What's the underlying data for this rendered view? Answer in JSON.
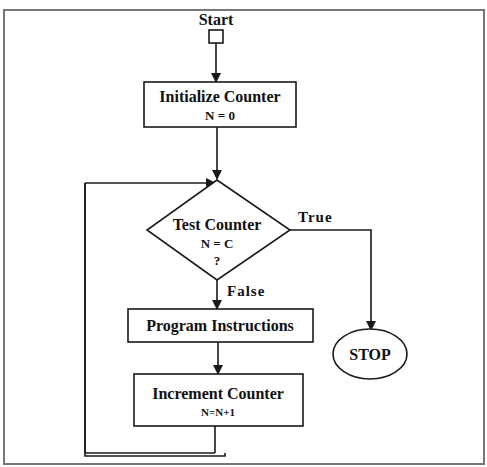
{
  "diagram": {
    "type": "flowchart",
    "start": {
      "label": "Start"
    },
    "nodes": [
      {
        "id": "init",
        "shape": "rectangle",
        "title": "Initialize Counter",
        "subtitle": "N = 0"
      },
      {
        "id": "test",
        "shape": "diamond",
        "title": "Test Counter",
        "line2": "N = C",
        "line3": "?"
      },
      {
        "id": "program",
        "shape": "rectangle",
        "title": "Program Instructions"
      },
      {
        "id": "increment",
        "shape": "rectangle",
        "title": "Increment Counter",
        "subtitle": "N=N+1"
      },
      {
        "id": "stop",
        "shape": "ellipse",
        "title": "STOP"
      }
    ],
    "edges": [
      {
        "from": "start",
        "to": "init"
      },
      {
        "from": "init",
        "to": "test"
      },
      {
        "from": "test",
        "to": "stop",
        "label": "True"
      },
      {
        "from": "test",
        "to": "program",
        "label": "False"
      },
      {
        "from": "program",
        "to": "increment"
      },
      {
        "from": "increment",
        "to": "test",
        "label": ""
      }
    ],
    "edge_labels": {
      "true": "True",
      "false": "False"
    },
    "colors": {
      "stroke": "#1a1a1a",
      "frame": "#777777",
      "background": "#ffffff"
    }
  }
}
